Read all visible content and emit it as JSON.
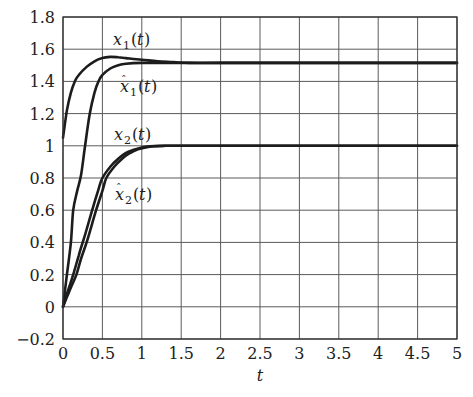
{
  "chart_data": {
    "type": "line",
    "title": "",
    "xlabel": "t",
    "ylabel": "",
    "xlim": [
      0,
      5
    ],
    "ylim": [
      -0.2,
      1.8
    ],
    "grid": true,
    "x_ticks": [
      0,
      0.5,
      1,
      1.5,
      2,
      2.5,
      3,
      3.5,
      4,
      4.5,
      5
    ],
    "x_tick_labels": [
      "0",
      "0.5",
      "1",
      "1.5",
      "2",
      "2.5",
      "3",
      "3.5",
      "4",
      "4.5",
      "5"
    ],
    "y_ticks": [
      -0.2,
      0,
      0.2,
      0.4,
      0.6,
      0.8,
      1,
      1.2,
      1.4,
      1.6,
      1.8
    ],
    "y_tick_labels": [
      "−0.2",
      "0",
      "0.2",
      "0.4",
      "0.6",
      "0.8",
      "1",
      "1.2",
      "1.4",
      "1.6",
      "1.8"
    ],
    "series": [
      {
        "name": "x1(t)",
        "label_main": "x",
        "label_sub": "1",
        "label_suffix": "(t)",
        "hat": false,
        "label_pos": [
          113,
          45
        ],
        "x": [
          0,
          0.05,
          0.1,
          0.15,
          0.2,
          0.3,
          0.4,
          0.5,
          0.6,
          0.7,
          0.8,
          1.0,
          1.2,
          1.4,
          1.6,
          2,
          3,
          4,
          5
        ],
        "y": [
          1.05,
          1.22,
          1.33,
          1.4,
          1.44,
          1.49,
          1.525,
          1.545,
          1.552,
          1.55,
          1.545,
          1.535,
          1.525,
          1.52,
          1.515,
          1.515,
          1.515,
          1.515,
          1.515
        ]
      },
      {
        "name": "x̂1(t)",
        "label_main": "x",
        "label_sub": "1",
        "label_suffix": "(t)",
        "hat": true,
        "label_pos": [
          120,
          92
        ],
        "x": [
          0,
          0.05,
          0.1,
          0.13,
          0.18,
          0.23,
          0.28,
          0.34,
          0.4,
          0.45,
          0.5,
          0.6,
          0.7,
          0.8,
          1.0,
          1.2,
          1.4,
          1.6,
          2,
          3,
          4,
          5
        ],
        "y": [
          0,
          0.2,
          0.4,
          0.6,
          0.72,
          0.82,
          1.0,
          1.2,
          1.33,
          1.4,
          1.44,
          1.48,
          1.5,
          1.51,
          1.515,
          1.515,
          1.515,
          1.515,
          1.515,
          1.515,
          1.515,
          1.515
        ]
      },
      {
        "name": "x2(t)",
        "label_main": "x",
        "label_sub": "2",
        "label_suffix": "(t)",
        "hat": false,
        "label_pos": [
          114,
          140
        ],
        "x": [
          0,
          0.05,
          0.13,
          0.2,
          0.25,
          0.3,
          0.37,
          0.45,
          0.5,
          0.6,
          0.7,
          0.8,
          0.9,
          1.0,
          1.1,
          1.3,
          1.5,
          2,
          3,
          4,
          5
        ],
        "y": [
          0,
          0.08,
          0.2,
          0.32,
          0.4,
          0.48,
          0.6,
          0.73,
          0.8,
          0.87,
          0.92,
          0.955,
          0.975,
          0.99,
          0.997,
          1.0,
          1.0,
          1.0,
          1.0,
          1.0,
          1.0
        ]
      },
      {
        "name": "x̂2(t)",
        "label_main": "x",
        "label_sub": "2",
        "label_suffix": "(t)",
        "hat": true,
        "label_pos": [
          115,
          200
        ],
        "x": [
          0,
          0.05,
          0.1,
          0.17,
          0.23,
          0.3,
          0.36,
          0.42,
          0.5,
          0.55,
          0.65,
          0.75,
          0.85,
          0.95,
          1.05,
          1.15,
          1.3,
          1.5,
          2,
          3,
          4,
          5
        ],
        "y": [
          0,
          0.06,
          0.12,
          0.2,
          0.3,
          0.4,
          0.5,
          0.6,
          0.72,
          0.8,
          0.87,
          0.92,
          0.955,
          0.978,
          0.99,
          0.997,
          1.0,
          1.0,
          1.0,
          1.0,
          1.0,
          1.0
        ]
      }
    ],
    "plot_area_px": {
      "left": 63,
      "top": 17,
      "right": 457,
      "bottom": 339
    }
  },
  "axis": {
    "x_label": "t"
  }
}
